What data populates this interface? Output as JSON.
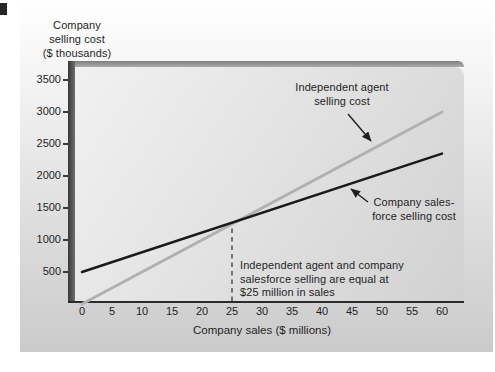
{
  "y_axis": {
    "title_lines": [
      "Company",
      "selling cost",
      "($ thousands)"
    ],
    "tick_labels": [
      "500",
      "1000",
      "1500",
      "2000",
      "2500",
      "3000",
      "3500"
    ],
    "range": [
      0,
      3500
    ]
  },
  "x_axis": {
    "title": "Company sales ($ millions)",
    "tick_labels": [
      "0",
      "5",
      "10",
      "15",
      "20",
      "25",
      "30",
      "35",
      "40",
      "45",
      "50",
      "55",
      "60"
    ],
    "range": [
      0,
      60
    ]
  },
  "annotations": {
    "independent_label_line1": "Independent agent",
    "independent_label_line2": "selling cost",
    "company_label_line1": "Company sales-",
    "company_label_line2": "force selling cost",
    "breakeven_note_line1": "Independent agent and company",
    "breakeven_note_line2": "salesforce selling are equal at",
    "breakeven_note_line3": "$25 million in sales"
  },
  "chart_data": {
    "type": "line",
    "x": [
      0,
      60
    ],
    "series": [
      {
        "name": "Independent agent selling cost",
        "color": "#b0b0b0",
        "stroke_width": 3,
        "values": [
          0,
          3000
        ]
      },
      {
        "name": "Company salesforce selling cost",
        "color": "#1a1a1a",
        "stroke_width": 2.5,
        "values": [
          500,
          2350
        ]
      }
    ],
    "breakeven_point": {
      "x": 25,
      "y": 1250
    },
    "xlabel": "Company sales ($ millions)",
    "ylabel": "Company selling cost ($ thousands)",
    "xlim": [
      0,
      60
    ],
    "ylim": [
      0,
      3500
    ],
    "x_ticks": [
      0,
      5,
      10,
      15,
      20,
      25,
      30,
      35,
      40,
      45,
      50,
      55,
      60
    ],
    "y_ticks": [
      500,
      1000,
      1500,
      2000,
      2500,
      3000,
      3500
    ],
    "grid": false,
    "legend": "inline-arrow-annotations"
  },
  "colors": {
    "gray_line": "#b0b0b0",
    "black_line": "#1a1a1a",
    "dashed_line": "#454545",
    "text": "#1f1f1f"
  }
}
